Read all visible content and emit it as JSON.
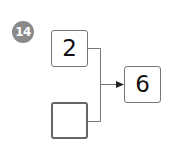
{
  "problem": {
    "number": "14",
    "inputs": [
      {
        "value": "2"
      },
      {
        "value": ""
      }
    ],
    "output": {
      "value": "6"
    }
  },
  "colors": {
    "badge": "#8a8a8a",
    "line": "#777777"
  }
}
